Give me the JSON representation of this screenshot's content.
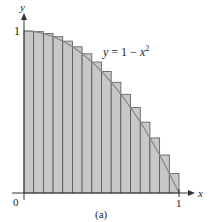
{
  "chart_data": {
    "type": "bar",
    "title": "",
    "caption": "(a)",
    "xlabel": "x",
    "ylabel": "y",
    "curve_label": "y = 1 − x²",
    "curve": "y = 1 - x^2",
    "xlim": [
      0,
      1
    ],
    "ylim": [
      0,
      1
    ],
    "x_ticks": [
      "0",
      "1"
    ],
    "y_ticks": [
      "1"
    ],
    "n_rectangles": 16,
    "rectangle_width": 0.0625,
    "x_left_endpoints": [
      0,
      0.0625,
      0.125,
      0.1875,
      0.25,
      0.3125,
      0.375,
      0.4375,
      0.5,
      0.5625,
      0.625,
      0.6875,
      0.75,
      0.8125,
      0.875,
      0.9375
    ],
    "values": [
      1.0,
      0.9961,
      0.9844,
      0.9648,
      0.9375,
      0.9023,
      0.8594,
      0.8086,
      0.75,
      0.6836,
      0.6094,
      0.5273,
      0.4375,
      0.3398,
      0.2344,
      0.1211
    ],
    "grid": false,
    "legend": "none"
  },
  "labels": {
    "y_axis": "y",
    "x_axis": "x",
    "y_one": "1",
    "x_zero": "0",
    "x_one": "1",
    "curve_lhs": "y",
    "curve_eq": " = 1 − ",
    "curve_x": "x",
    "curve_exp": "2",
    "caption": "(a)"
  },
  "colors": {
    "bar_fill": "#c8c8c8",
    "bar_stroke": "#555555",
    "curve": "#888888",
    "gap_fill": "#ececec",
    "axis": "#333333"
  }
}
